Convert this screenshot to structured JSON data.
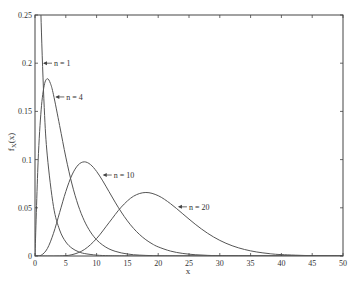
{
  "chart_data": {
    "type": "line",
    "title": "",
    "xlabel": "x",
    "ylabel": "f_X(x)",
    "xlim": [
      0,
      50
    ],
    "ylim": [
      0,
      0.25
    ],
    "grid": false,
    "legend": "none (inline arrow labels)",
    "xticks": [
      0,
      5,
      10,
      15,
      20,
      25,
      30,
      35,
      40,
      45,
      50
    ],
    "yticks": [
      0,
      0.05,
      0.1,
      0.15,
      0.2,
      0.25
    ],
    "ytick_labels": [
      "0",
      "0.05",
      "0.1",
      "0.15",
      "0.2",
      "0.25"
    ],
    "series": [
      {
        "name": "n = 1",
        "x": [
          0.093,
          0.1,
          0.2,
          0.3,
          0.5,
          0.75,
          1,
          1.5,
          2,
          3,
          4,
          5,
          6,
          7,
          8,
          10,
          12,
          15,
          20,
          50
        ],
        "y": [
          0.25,
          1.2,
          0.8072,
          0.6269,
          0.4394,
          0.3166,
          0.242,
          0.1539,
          0.1038,
          0.0514,
          0.027,
          0.0146,
          0.0081,
          0.0046,
          0.0026,
          0.0009,
          0.0003,
          0.0001,
          0,
          0
        ],
        "label_anchor": [
          1.3,
          0.2
        ]
      },
      {
        "name": "n = 4",
        "x": [
          0,
          0.5,
          1,
          1.5,
          2,
          2.5,
          3,
          4,
          5,
          6,
          7,
          8,
          9,
          10,
          11,
          12,
          13,
          14,
          15,
          16,
          17,
          18,
          19,
          20,
          25,
          50
        ],
        "y": [
          0,
          0.0974,
          0.1516,
          0.1771,
          0.1839,
          0.1791,
          0.1673,
          0.1353,
          0.1026,
          0.0747,
          0.0528,
          0.0366,
          0.025,
          0.0168,
          0.0113,
          0.0074,
          0.0049,
          0.0032,
          0.0021,
          0.0013,
          0.0009,
          0.0006,
          0.0004,
          0.0002,
          0,
          0
        ],
        "label_anchor": [
          3.3,
          0.165
        ]
      },
      {
        "name": "n = 10",
        "x": [
          0,
          1,
          2,
          3,
          4,
          5,
          6,
          7,
          8,
          9,
          10,
          11,
          12,
          13,
          14,
          15,
          16,
          17,
          18,
          19,
          20,
          22,
          24,
          26,
          28,
          30,
          35,
          40,
          50
        ],
        "y": [
          0,
          0.00079,
          0.00766,
          0.02353,
          0.04511,
          0.0668,
          0.08402,
          0.0944,
          0.09768,
          0.0949,
          0.08773,
          0.07791,
          0.06693,
          0.05591,
          0.04561,
          0.03646,
          0.02863,
          0.02213,
          0.01687,
          0.0127,
          0.00946,
          0.00509,
          0.00265,
          0.00134,
          0.00067,
          0.00032,
          5e-05,
          0,
          0
        ],
        "label_anchor": [
          11,
          0.084
        ]
      },
      {
        "name": "n = 20",
        "x": [
          0,
          2,
          4,
          6,
          8,
          10,
          12,
          14,
          16,
          18,
          20,
          22,
          24,
          26,
          28,
          30,
          32,
          34,
          36,
          38,
          40,
          45,
          50
        ],
        "y": [
          0,
          0,
          0.0001,
          0.00135,
          0.00662,
          0.01813,
          0.03443,
          0.0507,
          0.06204,
          0.06588,
          0.06256,
          0.05427,
          0.04368,
          0.03303,
          0.02367,
          0.0162,
          0.01066,
          0.00676,
          0.00416,
          0.00249,
          0.00145,
          0.00034,
          7e-05
        ],
        "label_anchor": [
          23.2,
          0.051
        ]
      }
    ]
  },
  "axes": {
    "x_label": "x",
    "y_label_main": "f",
    "y_label_sub": "X",
    "y_label_arg": "(x)"
  }
}
